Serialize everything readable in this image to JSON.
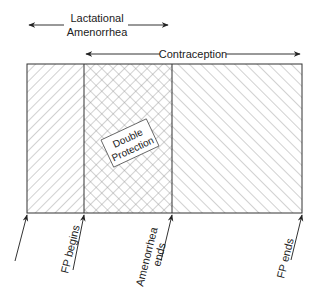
{
  "diagram": {
    "top_labels": {
      "lactational_line1": "Lactational",
      "lactational_line2": "Amenorrhea",
      "contraception": "Contraception"
    },
    "regions": [
      {
        "name": "lactational-only",
        "pattern": "diagonal-forward-hatch"
      },
      {
        "name": "double-protection",
        "pattern": "cross-hatch",
        "label_line1": "Double",
        "label_line2": "Protection"
      },
      {
        "name": "contraception-only",
        "pattern": "diagonal-back-hatch"
      }
    ],
    "bottom_markers": [
      {
        "label": ""
      },
      {
        "label": "FP begins"
      },
      {
        "label_line1": "Amenorrhea",
        "label_line2": "ends"
      },
      {
        "label": "FP ends"
      }
    ],
    "colors": {
      "line": "#333333",
      "hatch": "#9a9a9a",
      "background": "#ffffff"
    }
  }
}
